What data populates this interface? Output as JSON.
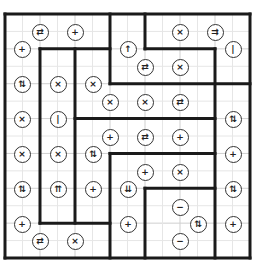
{
  "puzzle": {
    "grid": {
      "cols": 7,
      "rows": 7,
      "left": 5,
      "top": 14,
      "right": 250,
      "bottom": 258
    },
    "colors": {
      "thick_line": "#1a1a1a",
      "thin_line": "#cfcfcf",
      "circle_border": "#333333",
      "background": "#ffffff"
    },
    "thick_segments": [
      [
        0,
        0,
        7,
        0
      ],
      [
        7,
        0,
        7,
        7
      ],
      [
        0,
        7,
        7,
        7
      ],
      [
        0,
        0,
        0,
        7
      ],
      [
        3,
        0,
        3,
        2
      ],
      [
        1,
        1,
        3,
        1
      ],
      [
        1,
        1,
        1,
        6
      ],
      [
        2,
        1,
        2,
        6
      ],
      [
        1,
        6,
        3,
        6
      ],
      [
        4,
        0,
        4,
        1
      ],
      [
        4,
        1,
        6,
        1
      ],
      [
        6,
        1,
        6,
        7
      ],
      [
        3,
        2,
        7,
        2
      ],
      [
        2,
        3,
        6,
        3
      ],
      [
        3,
        4,
        6,
        4
      ],
      [
        3,
        4,
        3,
        7
      ],
      [
        4,
        5,
        6,
        5
      ],
      [
        4,
        5,
        4,
        7
      ]
    ],
    "clues": [
      {
        "x": 40,
        "y": 32,
        "symbol": "⇄",
        "icon": "left-right-arrows-icon"
      },
      {
        "x": 75,
        "y": 32,
        "symbol": "+",
        "icon": "plus-icon"
      },
      {
        "x": 180,
        "y": 32,
        "symbol": "×",
        "icon": "cross-icon"
      },
      {
        "x": 215,
        "y": 32,
        "symbol": "⇉",
        "icon": "double-right-arrow-icon"
      },
      {
        "x": 22,
        "y": 49,
        "symbol": "+",
        "icon": "plus-icon"
      },
      {
        "x": 128,
        "y": 49,
        "symbol": "↑",
        "icon": "up-arrow-icon"
      },
      {
        "x": 233,
        "y": 49,
        "symbol": "|",
        "icon": "bar-icon"
      },
      {
        "x": 145,
        "y": 67,
        "symbol": "⇄",
        "icon": "left-right-arrows-icon"
      },
      {
        "x": 180,
        "y": 67,
        "symbol": "×",
        "icon": "cross-icon"
      },
      {
        "x": 22,
        "y": 84,
        "symbol": "⇅",
        "icon": "up-down-arrows-icon"
      },
      {
        "x": 58,
        "y": 84,
        "symbol": "×",
        "icon": "cross-icon"
      },
      {
        "x": 93,
        "y": 84,
        "symbol": "×",
        "icon": "cross-icon"
      },
      {
        "x": 110,
        "y": 102,
        "symbol": "×",
        "icon": "cross-icon"
      },
      {
        "x": 145,
        "y": 102,
        "symbol": "×",
        "icon": "cross-icon"
      },
      {
        "x": 180,
        "y": 102,
        "symbol": "⇄",
        "icon": "left-right-arrows-icon"
      },
      {
        "x": 22,
        "y": 119,
        "symbol": "×",
        "icon": "cross-icon"
      },
      {
        "x": 58,
        "y": 119,
        "symbol": "|",
        "icon": "bar-icon"
      },
      {
        "x": 233,
        "y": 119,
        "symbol": "⇅",
        "icon": "up-down-arrows-icon"
      },
      {
        "x": 110,
        "y": 137,
        "symbol": "+",
        "icon": "plus-icon"
      },
      {
        "x": 145,
        "y": 137,
        "symbol": "⇄",
        "icon": "left-right-arrows-icon"
      },
      {
        "x": 180,
        "y": 137,
        "symbol": "+",
        "icon": "plus-icon"
      },
      {
        "x": 22,
        "y": 154,
        "symbol": "×",
        "icon": "cross-icon"
      },
      {
        "x": 58,
        "y": 154,
        "symbol": "×",
        "icon": "cross-icon"
      },
      {
        "x": 93,
        "y": 154,
        "symbol": "⇅",
        "icon": "up-down-arrows-icon"
      },
      {
        "x": 233,
        "y": 154,
        "symbol": "+",
        "icon": "plus-icon"
      },
      {
        "x": 145,
        "y": 172,
        "symbol": "+",
        "icon": "plus-icon"
      },
      {
        "x": 180,
        "y": 172,
        "symbol": "×",
        "icon": "cross-icon"
      },
      {
        "x": 22,
        "y": 189,
        "symbol": "⇅",
        "icon": "up-down-arrows-icon"
      },
      {
        "x": 58,
        "y": 189,
        "symbol": "⇈",
        "icon": "double-up-arrow-icon"
      },
      {
        "x": 93,
        "y": 189,
        "symbol": "+",
        "icon": "plus-icon"
      },
      {
        "x": 128,
        "y": 189,
        "symbol": "⇊",
        "icon": "double-down-arrow-icon"
      },
      {
        "x": 233,
        "y": 189,
        "symbol": "⇅",
        "icon": "up-down-arrows-icon"
      },
      {
        "x": 180,
        "y": 207,
        "symbol": "−",
        "icon": "minus-icon"
      },
      {
        "x": 22,
        "y": 224,
        "symbol": "+",
        "icon": "plus-icon"
      },
      {
        "x": 128,
        "y": 224,
        "symbol": "+",
        "icon": "plus-icon"
      },
      {
        "x": 198,
        "y": 224,
        "symbol": "⇅",
        "icon": "up-down-arrows-icon"
      },
      {
        "x": 233,
        "y": 224,
        "symbol": "+",
        "icon": "plus-icon"
      },
      {
        "x": 40,
        "y": 241,
        "symbol": "⇄",
        "icon": "left-right-arrows-icon"
      },
      {
        "x": 75,
        "y": 241,
        "symbol": "×",
        "icon": "cross-icon"
      },
      {
        "x": 180,
        "y": 241,
        "symbol": "−",
        "icon": "minus-icon"
      }
    ]
  }
}
